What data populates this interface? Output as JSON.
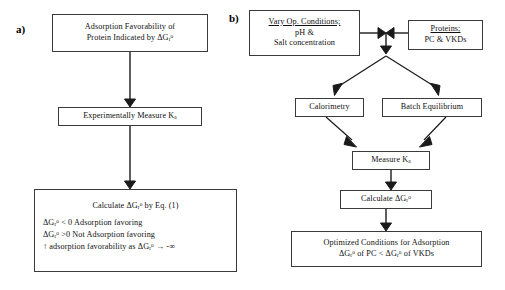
{
  "figure": {
    "background": "#ffffff",
    "stroke_color": "#333333",
    "text_color": "#111111"
  },
  "panels": [
    {
      "id": "panel-a",
      "label": "a)",
      "nodes": [
        {
          "id": "a-node-1",
          "name": "adsorption-favorability-box",
          "lines": [
            "Adsorption Favorability of",
            "Protein Indicated by ΔGᵣ°"
          ]
        },
        {
          "id": "a-node-2",
          "name": "experimentally-measure-ka-box",
          "lines": [
            "Experimentally Measure Kₐ"
          ]
        },
        {
          "id": "a-node-3",
          "name": "calculate-dgr-box",
          "heading": "Calculate ΔGᵣ° by Eq. (1)",
          "lines": [
            "ΔGᵣ° < 0 Adsorption favoring",
            "ΔGᵣ° >0 Not Adsorption favoring",
            "↑ adsorption favorability as ΔGᵣ° → -∞"
          ]
        }
      ],
      "edges": [
        {
          "name": "edge-a1-to-a2",
          "from": "a-node-1",
          "to": "a-node-2",
          "style": "straight-down-arrow"
        },
        {
          "name": "edge-a2-to-a3",
          "from": "a-node-2",
          "to": "a-node-3",
          "style": "straight-down-arrow"
        }
      ]
    },
    {
      "id": "panel-b",
      "label": "b)",
      "nodes": [
        {
          "id": "b-node-cond",
          "name": "vary-operating-conditions-box",
          "heading": "Vary Op. Conditions;",
          "lines": [
            "pH &",
            "Salt concentration"
          ]
        },
        {
          "id": "b-node-prot",
          "name": "proteins-box",
          "heading": "Proteins;",
          "lines": [
            "PC & VKDs"
          ]
        },
        {
          "id": "b-node-cal",
          "name": "calorimetry-box",
          "lines": [
            "Calorimetry"
          ]
        },
        {
          "id": "b-node-batch",
          "name": "batch-equilibrium-box",
          "lines": [
            "Batch Equilibrium"
          ]
        },
        {
          "id": "b-node-measure",
          "name": "measure-ka-box",
          "lines": [
            "Measure Kₐ"
          ]
        },
        {
          "id": "b-node-calc",
          "name": "calculate-dgr-box",
          "lines": [
            "Calculate ΔGᵣ°"
          ]
        },
        {
          "id": "b-node-opt",
          "name": "optimized-conditions-box",
          "lines": [
            "Optimized Conditions for Adsorption",
            "ΔGᵣ° of PC < ΔGᵣ° of VKDs"
          ]
        }
      ],
      "edges": [
        {
          "name": "edge-conditions-to-junction",
          "from": "b-node-cond",
          "to": "junction",
          "style": "right-arrow"
        },
        {
          "name": "edge-proteins-to-junction",
          "from": "b-node-prot",
          "to": "junction",
          "style": "left-arrow"
        },
        {
          "name": "edge-junction-down",
          "from": "junction",
          "to": "split",
          "style": "down-arrow"
        },
        {
          "name": "edge-split-to-calorimetry",
          "from": "split",
          "to": "b-node-cal",
          "style": "diagonal-arrow"
        },
        {
          "name": "edge-split-to-batch",
          "from": "split",
          "to": "b-node-batch",
          "style": "diagonal-arrow"
        },
        {
          "name": "edge-calorimetry-to-measure",
          "from": "b-node-cal",
          "to": "b-node-measure",
          "style": "diagonal-arrow"
        },
        {
          "name": "edge-batch-to-measure",
          "from": "b-node-batch",
          "to": "b-node-measure",
          "style": "diagonal-arrow"
        },
        {
          "name": "edge-measure-to-calculate",
          "from": "b-node-measure",
          "to": "b-node-calc",
          "style": "straight-down-arrow"
        },
        {
          "name": "edge-calculate-to-optimized",
          "from": "b-node-calc",
          "to": "b-node-opt",
          "style": "straight-down-arrow"
        }
      ]
    }
  ]
}
